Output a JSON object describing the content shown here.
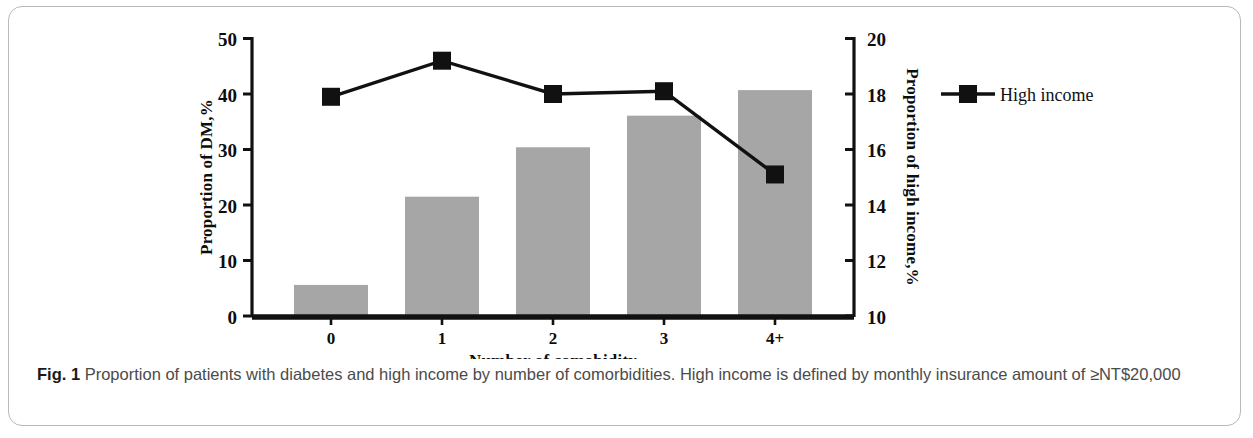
{
  "figure": {
    "caption_label": "Fig. 1",
    "caption_text": " Proportion of patients with diabetes and high income by number of comorbidities. High income is defined by monthly insurance amount of ≥NT$20,000"
  },
  "chart_data": {
    "type": "bar",
    "title": "",
    "xlabel": "Number of comobidity",
    "categories": [
      "0",
      "1",
      "2",
      "3",
      "4+"
    ],
    "series": [
      {
        "name": "Proportion of DM",
        "type": "bar",
        "axis": "left",
        "color": "#a6a6a6",
        "values": [
          5.6,
          21.5,
          30.4,
          36.1,
          40.7
        ]
      },
      {
        "name": "High income",
        "type": "line",
        "axis": "right",
        "color": "#111111",
        "marker": "square",
        "values": [
          17.9,
          19.2,
          18.0,
          18.1,
          15.1
        ]
      }
    ],
    "left_axis": {
      "label": "Proportion of DM,%",
      "ticks": [
        "0",
        "10",
        "20",
        "30",
        "40",
        "50"
      ],
      "tick_values": [
        0,
        10,
        20,
        30,
        40,
        50
      ],
      "ylim": [
        0,
        50
      ]
    },
    "right_axis": {
      "label": "Proportion of high income,%",
      "ticks": [
        "10",
        "12",
        "14",
        "16",
        "18",
        "20"
      ],
      "tick_values": [
        10,
        12,
        14,
        16,
        18,
        20
      ],
      "ylim": [
        10,
        20
      ]
    },
    "legend": {
      "position": "right",
      "entries": [
        {
          "label": "High income",
          "marker": "black-square-line"
        }
      ]
    },
    "grid": false
  }
}
